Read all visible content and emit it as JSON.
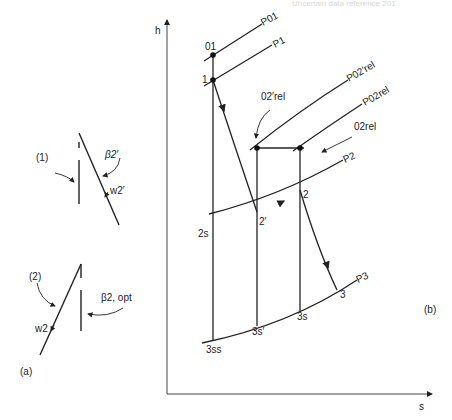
{
  "header_fragment": "Uncertain data reference 201",
  "panel_a": {
    "label": "(a)",
    "case1": {
      "label": "(1)",
      "angle_label": "β2′",
      "velocity_label": "w2′"
    },
    "case2": {
      "label": "(2)",
      "angle_label": "β2, opt",
      "velocity_label": "w2"
    }
  },
  "panel_b": {
    "label": "(b)",
    "axes": {
      "y": "h",
      "x": "s"
    },
    "isobars": [
      "P01",
      "P1",
      "P02′rel",
      "P02rel",
      "P2",
      "P3"
    ],
    "states": [
      "01",
      "1",
      "2s",
      "2′",
      "2",
      "3",
      "3ss",
      "3s′",
      "3s"
    ],
    "annotations": [
      "02′rel",
      "02rel"
    ]
  }
}
